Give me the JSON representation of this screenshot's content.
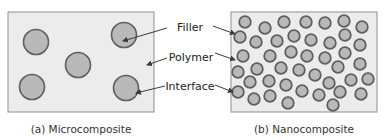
{
  "colors": {
    "box_fill": "#ececec",
    "box_stroke": "#8f8f8f",
    "particle_fill": "#b9b9b9",
    "particle_stroke": "#5f5f5f",
    "arrow": "#3a3a3a",
    "text": "#222222"
  },
  "labels": {
    "filler": "Filler",
    "polymer": "Polymer",
    "interface": "Interface"
  },
  "panels": [
    {
      "id": "micro",
      "caption": "(a) Microcomposite",
      "box": {
        "x": 8,
        "y": 12,
        "w": 146,
        "h": 100
      },
      "particle_radius": 12.5,
      "particles": [
        [
          36,
          42
        ],
        [
          78,
          65
        ],
        [
          124,
          35
        ],
        [
          32,
          87
        ],
        [
          126,
          88
        ]
      ]
    },
    {
      "id": "nano",
      "caption": "(b) Nanocomposite",
      "box": {
        "x": 231,
        "y": 12,
        "w": 146,
        "h": 100
      },
      "particle_radius": 5.8,
      "particles": [
        [
          245,
          22
        ],
        [
          265,
          28
        ],
        [
          284,
          22
        ],
        [
          306,
          22
        ],
        [
          325,
          23
        ],
        [
          344,
          21
        ],
        [
          362,
          27
        ],
        [
          240,
          37
        ],
        [
          256,
          42
        ],
        [
          277,
          41
        ],
        [
          294,
          36
        ],
        [
          311,
          40
        ],
        [
          330,
          43
        ],
        [
          345,
          35
        ],
        [
          360,
          45
        ],
        [
          243,
          56
        ],
        [
          270,
          56
        ],
        [
          291,
          52
        ],
        [
          307,
          56
        ],
        [
          325,
          58
        ],
        [
          345,
          53
        ],
        [
          360,
          64
        ],
        [
          238,
          72
        ],
        [
          257,
          69
        ],
        [
          281,
          68
        ],
        [
          299,
          70
        ],
        [
          315,
          75
        ],
        [
          338,
          67
        ],
        [
          250,
          82
        ],
        [
          269,
          81
        ],
        [
          286,
          85
        ],
        [
          329,
          83
        ],
        [
          351,
          80
        ],
        [
          368,
          79
        ],
        [
          238,
          92
        ],
        [
          302,
          91
        ],
        [
          319,
          95
        ],
        [
          340,
          92
        ],
        [
          361,
          94
        ],
        [
          254,
          99
        ],
        [
          270,
          96
        ],
        [
          288,
          103
        ],
        [
          333,
          105
        ]
      ]
    }
  ],
  "arrows": [
    {
      "name": "filler-arrow-left",
      "from": [
        167,
        28
      ],
      "to": [
        123,
        41
      ]
    },
    {
      "name": "polymer-arrow-left",
      "from": [
        167,
        58
      ],
      "to": [
        147,
        65
      ]
    },
    {
      "name": "interface-arrow-left",
      "from": [
        165,
        86
      ],
      "to": [
        136,
        93
      ]
    },
    {
      "name": "filler-arrow-right",
      "from": [
        213,
        26
      ],
      "to": [
        235,
        34
      ]
    },
    {
      "name": "polymer-arrow-right",
      "from": [
        215,
        53
      ],
      "to": [
        235,
        60
      ]
    },
    {
      "name": "interface-arrow-right",
      "from": [
        215,
        85
      ],
      "to": [
        233,
        92
      ]
    }
  ]
}
